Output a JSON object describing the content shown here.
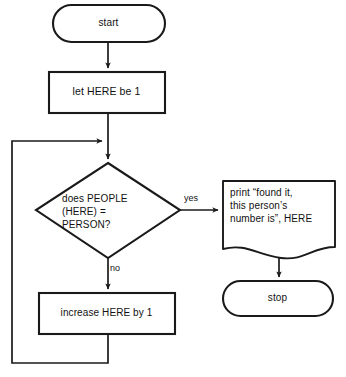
{
  "diagram": {
    "stroke_color": "#1a1a1a",
    "background_color": "#ffffff",
    "nodes": {
      "start": {
        "label": "start",
        "shape": "terminator"
      },
      "init": {
        "label": "let HERE be 1",
        "shape": "process"
      },
      "decision": {
        "label": "does PEOPLE\n(HERE) =\nPERSON?",
        "shape": "decision"
      },
      "print": {
        "label": "print “found it,\nthis person’s\nnumber is”, HERE",
        "shape": "document"
      },
      "stop": {
        "label": "stop",
        "shape": "terminator"
      },
      "increment": {
        "label": "increase HERE by 1",
        "shape": "process"
      }
    },
    "edges": {
      "yes": {
        "label": "yes"
      },
      "no": {
        "label": "no"
      }
    }
  }
}
